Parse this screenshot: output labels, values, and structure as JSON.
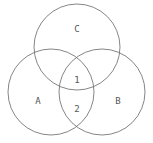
{
  "diagram": {
    "type": "venn",
    "stroke_color": "#666666",
    "sets": [
      {
        "id": "C",
        "label": "C",
        "cx": 77,
        "cy": 47,
        "r": 43,
        "label_x": 77,
        "label_y": 29
      },
      {
        "id": "A",
        "label": "A",
        "cx": 51,
        "cy": 92,
        "r": 43,
        "label_x": 38,
        "label_y": 101
      },
      {
        "id": "B",
        "label": "B",
        "cx": 102,
        "cy": 92,
        "r": 43,
        "label_x": 118,
        "label_y": 101
      }
    ],
    "regions": [
      {
        "id": "1",
        "label": "1",
        "x": 77,
        "y": 80
      },
      {
        "id": "2",
        "label": "2",
        "x": 77,
        "y": 109
      }
    ]
  }
}
